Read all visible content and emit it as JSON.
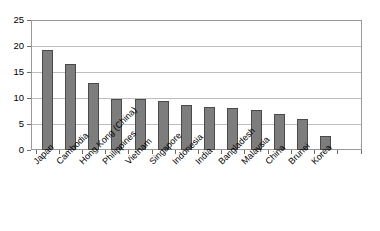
{
  "chart_data": {
    "type": "bar",
    "title": "",
    "subtitle": "",
    "xlabel": "",
    "ylabel": "",
    "ylim": [
      0,
      25
    ],
    "yticks": [
      0,
      5,
      10,
      15,
      20,
      25
    ],
    "grid": true,
    "legend": false,
    "legend_position": "none",
    "orientation": "vertical",
    "bar_color": "#7d7d7d",
    "bar_border_color": "#4a4a4a",
    "gridline_color": "#bdbdbd",
    "frame_color": "#9a9a9a",
    "label_rotation": -45,
    "categories": [
      "Japan",
      "Cambodia",
      "Hong Kong (China)",
      "Philippines",
      "Vietnam",
      "Singapore",
      "Indonesia",
      "India",
      "Bangladesh",
      "Malaysia",
      "China",
      "Brunei",
      "Korea"
    ],
    "values": [
      19.2,
      16.5,
      12.9,
      9.9,
      9.9,
      9.4,
      8.6,
      8.2,
      8.0,
      7.7,
      6.9,
      5.9,
      2.6
    ],
    "series": [
      {
        "name": "",
        "values": [
          19.2,
          16.5,
          12.9,
          9.9,
          9.9,
          9.4,
          8.6,
          8.2,
          8.0,
          7.7,
          6.9,
          5.9,
          2.6
        ]
      }
    ]
  }
}
